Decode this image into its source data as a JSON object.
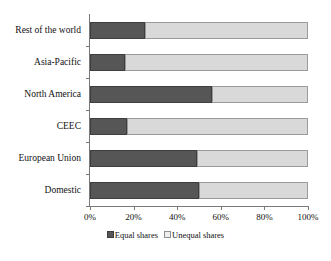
{
  "chart_data": {
    "type": "bar",
    "orientation": "horizontal",
    "stacked": true,
    "title": "",
    "xlabel": "",
    "ylabel": "",
    "xlim": [
      0,
      100
    ],
    "xticks": [
      "0%",
      "20%",
      "40%",
      "60%",
      "80%",
      "100%"
    ],
    "xtick_values": [
      0,
      20,
      40,
      60,
      80,
      100
    ],
    "grid": false,
    "legend_position": "bottom-center",
    "categories": [
      "Rest of the world",
      "Asia-Pacific",
      "North America",
      "CEEC",
      "European Union",
      "Domestic"
    ],
    "series": [
      {
        "name": "Equal shares",
        "color": "#565656",
        "values": [
          25,
          16,
          56,
          17,
          49,
          50
        ]
      },
      {
        "name": "Unequal shares",
        "color": "#d9d9d9",
        "values": [
          75,
          84,
          44,
          83,
          51,
          50
        ]
      }
    ]
  },
  "legend": {
    "items": [
      {
        "label": "Equal shares"
      },
      {
        "label": "Unequal shares"
      }
    ]
  },
  "colors": {
    "equal": "#565656",
    "unequal": "#d9d9d9",
    "axis": "#7a7a7a",
    "text": "#111111",
    "background": "#ffffff"
  }
}
